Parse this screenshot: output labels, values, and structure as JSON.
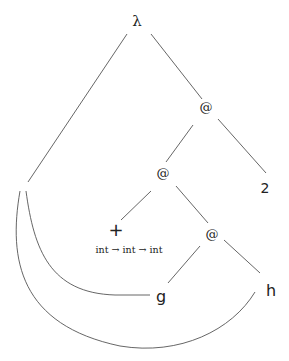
{
  "diagram": {
    "nodes": {
      "lambda": "λ",
      "app_root": "@",
      "app_inner": "@",
      "app_lower": "@",
      "const_two": "2",
      "plus": "+",
      "plus_type": "int → int → int",
      "var_g": "g",
      "var_h": "h"
    },
    "edges": [
      {
        "from": "lambda",
        "to": "binder"
      },
      {
        "from": "lambda",
        "to": "app_root"
      },
      {
        "from": "app_root",
        "to": "app_inner"
      },
      {
        "from": "app_root",
        "to": "const_two"
      },
      {
        "from": "app_inner",
        "to": "plus"
      },
      {
        "from": "app_inner",
        "to": "app_lower"
      },
      {
        "from": "app_lower",
        "to": "var_g"
      },
      {
        "from": "app_lower",
        "to": "var_h"
      },
      {
        "from": "binder",
        "to": "var_g",
        "style": "curve"
      },
      {
        "from": "binder",
        "to": "var_h",
        "style": "curve"
      }
    ]
  }
}
